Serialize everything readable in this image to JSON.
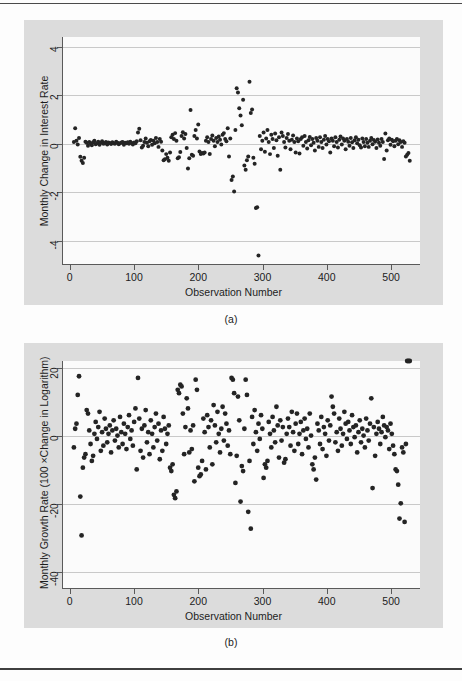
{
  "figure": {
    "panels": [
      {
        "caption": "(a)",
        "xlabel": "Observation Number",
        "ylabel": "Monthly Change in Interest Rate",
        "xticks": [
          "0",
          "100",
          "200",
          "300",
          "400",
          "500"
        ],
        "yticks": [
          "4",
          "2",
          "0",
          "-2",
          "-4"
        ]
      },
      {
        "caption": "(b)",
        "xlabel": "Observation Number",
        "ylabel": "Monthly Growth Rate (100 ×Change in Logarithm)",
        "xticks": [
          "0",
          "100",
          "200",
          "300",
          "400",
          "500"
        ],
        "yticks": [
          "20",
          "0",
          "-20",
          "-40"
        ]
      }
    ]
  },
  "colors": {
    "marker": "#242424",
    "graph_region": "#dcdcdc",
    "plot_region": "#fbfbfb",
    "gridline": "#c9c9c9",
    "axis": "#5a5a5a",
    "rule": "#4a4a4a"
  },
  "chart_data": [
    {
      "type": "scatter",
      "title": "",
      "panel": "(a)",
      "xlabel": "Observation Number",
      "ylabel": "Monthly Change in Interest Rate",
      "xlim": [
        -12,
        545
      ],
      "ylim": [
        -5.0,
        4.4
      ],
      "xticks": [
        0,
        100,
        200,
        300,
        400,
        500
      ],
      "yticks": [
        4,
        2,
        0,
        -2,
        -4
      ],
      "grid": true,
      "gridlines_y": [
        4,
        2,
        0,
        -2,
        -4
      ],
      "legend": null,
      "x": [
        5,
        7,
        9,
        11,
        13,
        15,
        17,
        19,
        21,
        23,
        25,
        27,
        29,
        31,
        33,
        35,
        37,
        39,
        41,
        43,
        45,
        47,
        49,
        51,
        53,
        55,
        57,
        59,
        61,
        63,
        65,
        67,
        69,
        71,
        73,
        75,
        77,
        79,
        81,
        83,
        85,
        87,
        89,
        91,
        93,
        95,
        97,
        99,
        101,
        103,
        105,
        107,
        109,
        111,
        113,
        115,
        117,
        119,
        121,
        123,
        125,
        127,
        129,
        131,
        133,
        135,
        137,
        139,
        141,
        143,
        145,
        147,
        149,
        151,
        153,
        155,
        157,
        159,
        161,
        163,
        165,
        167,
        169,
        171,
        173,
        175,
        177,
        179,
        181,
        183,
        185,
        187,
        189,
        191,
        193,
        195,
        197,
        199,
        201,
        203,
        205,
        207,
        209,
        211,
        213,
        215,
        217,
        219,
        221,
        223,
        225,
        227,
        229,
        231,
        233,
        235,
        237,
        239,
        241,
        243,
        245,
        247,
        249,
        251,
        253,
        255,
        257,
        259,
        261,
        263,
        265,
        267,
        269,
        271,
        273,
        275,
        277,
        279,
        281,
        283,
        285,
        287,
        289,
        291,
        293,
        295,
        297,
        299,
        301,
        303,
        305,
        307,
        309,
        311,
        313,
        315,
        317,
        319,
        321,
        323,
        325,
        327,
        329,
        331,
        333,
        335,
        337,
        339,
        341,
        343,
        345,
        347,
        349,
        351,
        353,
        355,
        357,
        359,
        361,
        363,
        365,
        367,
        369,
        371,
        373,
        375,
        377,
        379,
        381,
        383,
        385,
        387,
        389,
        391,
        393,
        395,
        397,
        399,
        401,
        403,
        405,
        407,
        409,
        411,
        413,
        415,
        417,
        419,
        421,
        423,
        425,
        427,
        429,
        431,
        433,
        435,
        437,
        439,
        441,
        443,
        445,
        447,
        449,
        451,
        453,
        455,
        457,
        459,
        461,
        463,
        465,
        467,
        469,
        471,
        473,
        475,
        477,
        479,
        481,
        483,
        485,
        487,
        489,
        491,
        493,
        495,
        497,
        499,
        501,
        503,
        505,
        507,
        509,
        511,
        513,
        515,
        517,
        519,
        521,
        523,
        525,
        527,
        529
      ],
      "y": [
        0.05,
        0.62,
        0.1,
        -0.05,
        0.22,
        -0.56,
        -0.72,
        -0.82,
        -0.6,
        0.06,
        0.02,
        -0.1,
        0.05,
        0.0,
        -0.08,
        0.04,
        0.1,
        -0.04,
        0.0,
        0.06,
        -0.06,
        0.02,
        0.08,
        -0.02,
        0.0,
        0.05,
        -0.05,
        0.03,
        0.01,
        -0.03,
        0.04,
        0.0,
        -0.02,
        0.06,
        0.02,
        -0.04,
        0.0,
        0.03,
        0.05,
        -0.06,
        0.02,
        0.0,
        0.04,
        -0.02,
        0.06,
        0.01,
        -0.05,
        0.03,
        0.0,
        0.08,
        0.45,
        0.6,
        0.12,
        -0.18,
        -0.1,
        0.05,
        0.2,
        0.02,
        -0.12,
        0.08,
        0.14,
        -0.06,
        0.1,
        0.0,
        0.22,
        0.05,
        -0.15,
        0.18,
        0.06,
        -0.3,
        -0.7,
        -0.66,
        -0.45,
        -0.6,
        -0.72,
        -0.38,
        0.25,
        0.35,
        0.18,
        0.42,
        0.1,
        -0.62,
        -0.58,
        -0.36,
        0.3,
        0.46,
        0.2,
        0.38,
        -0.2,
        -1.05,
        -0.62,
        1.38,
        -0.48,
        -0.52,
        0.3,
        0.55,
        0.2,
        0.78,
        -0.34,
        -0.45,
        -0.4,
        -0.42,
        -0.38,
        0.1,
        0.25,
        0.05,
        -0.44,
        0.18,
        0.32,
        0.1,
        -0.12,
        0.22,
        0.05,
        0.28,
        0.15,
        -0.05,
        0.35,
        0.42,
        0.18,
        0.08,
        0.62,
        -0.55,
        0.2,
        -1.52,
        -1.38,
        -2.0,
        0.55,
        2.28,
        2.1,
        1.45,
        1.15,
        0.75,
        1.8,
        -0.92,
        -1.1,
        -0.7,
        -0.55,
        2.55,
        1.25,
        1.4,
        -0.6,
        -0.85,
        -2.68,
        -2.65,
        -4.65,
        0.3,
        -0.25,
        0.1,
        0.45,
        -0.35,
        0.2,
        0.55,
        0.05,
        -0.45,
        0.35,
        0.18,
        -0.2,
        0.4,
        0.12,
        -0.52,
        0.25,
        -1.1,
        0.45,
        0.3,
        0.05,
        -0.18,
        0.22,
        0.38,
        0.1,
        -0.25,
        0.15,
        0.32,
        0.05,
        -0.38,
        0.2,
        0.08,
        -0.42,
        0.18,
        0.25,
        -0.1,
        0.3,
        0.05,
        -0.22,
        0.12,
        0.26,
        -0.08,
        0.18,
        0.02,
        -0.3,
        0.22,
        0.1,
        -0.15,
        0.25,
        0.05,
        -0.2,
        0.15,
        0.3,
        -0.05,
        0.18,
        0.08,
        -0.38,
        0.2,
        0.1,
        -0.12,
        0.25,
        0.05,
        -0.18,
        0.15,
        0.28,
        -0.05,
        0.2,
        0.1,
        -0.25,
        0.18,
        0.06,
        -0.1,
        0.22,
        0.04,
        -0.2,
        0.12,
        0.25,
        0.0,
        0.15,
        -0.08,
        -0.18,
        0.2,
        0.05,
        -0.12,
        0.18,
        0.02,
        -0.15,
        0.1,
        0.22,
        -0.04,
        0.14,
        0.06,
        -0.2,
        0.16,
        0.02,
        -0.1,
        0.18,
        0.05,
        -0.65,
        0.4,
        -0.3,
        0.12,
        0.2,
        -0.06,
        0.15,
        0.08,
        -0.12,
        0.1,
        0.18,
        -0.04,
        0.12,
        0.05,
        -0.15,
        0.08,
        0.02,
        -0.55,
        -0.48,
        -0.4,
        -0.72,
        -0.25,
        -0.58,
        -0.35,
        -0.2,
        -0.1,
        -0.3
      ]
    },
    {
      "type": "scatter",
      "title": "",
      "panel": "(b)",
      "xlabel": "Observation Number",
      "ylabel": "Monthly Growth Rate (100 ×Change in Logarithm)",
      "xlim": [
        -12,
        545
      ],
      "ylim": [
        -45,
        22
      ],
      "xticks": [
        0,
        100,
        200,
        300,
        400,
        500
      ],
      "yticks": [
        20,
        0,
        -20,
        -40
      ],
      "grid": true,
      "gridlines_y": [
        20,
        0,
        -20,
        -40
      ],
      "legend": null,
      "x": [
        5,
        7,
        9,
        11,
        13,
        15,
        17,
        19,
        21,
        23,
        25,
        27,
        29,
        31,
        33,
        35,
        37,
        39,
        41,
        43,
        45,
        47,
        49,
        51,
        53,
        55,
        57,
        59,
        61,
        63,
        65,
        67,
        69,
        71,
        73,
        75,
        77,
        79,
        81,
        83,
        85,
        87,
        89,
        91,
        93,
        95,
        97,
        99,
        101,
        103,
        105,
        107,
        109,
        111,
        113,
        115,
        117,
        119,
        121,
        123,
        125,
        127,
        129,
        131,
        133,
        135,
        137,
        139,
        141,
        143,
        145,
        147,
        149,
        151,
        153,
        155,
        157,
        159,
        161,
        163,
        165,
        167,
        169,
        171,
        173,
        175,
        177,
        179,
        181,
        183,
        185,
        187,
        189,
        191,
        193,
        195,
        197,
        199,
        201,
        203,
        205,
        207,
        209,
        211,
        213,
        215,
        217,
        219,
        221,
        223,
        225,
        227,
        229,
        231,
        233,
        235,
        237,
        239,
        241,
        243,
        245,
        247,
        249,
        251,
        253,
        255,
        257,
        259,
        261,
        263,
        265,
        267,
        269,
        271,
        273,
        275,
        277,
        279,
        281,
        283,
        285,
        287,
        289,
        291,
        293,
        295,
        297,
        299,
        301,
        303,
        305,
        307,
        309,
        311,
        313,
        315,
        317,
        319,
        321,
        323,
        325,
        327,
        329,
        331,
        333,
        335,
        337,
        339,
        341,
        343,
        345,
        347,
        349,
        351,
        353,
        355,
        357,
        359,
        361,
        363,
        365,
        367,
        369,
        371,
        373,
        375,
        377,
        379,
        381,
        383,
        385,
        387,
        389,
        391,
        393,
        395,
        397,
        399,
        401,
        403,
        405,
        407,
        409,
        411,
        413,
        415,
        417,
        419,
        421,
        423,
        425,
        427,
        429,
        431,
        433,
        435,
        437,
        439,
        441,
        443,
        445,
        447,
        449,
        451,
        453,
        455,
        457,
        459,
        461,
        463,
        465,
        467,
        469,
        471,
        473,
        475,
        477,
        479,
        481,
        483,
        485,
        487,
        489,
        491,
        493,
        495,
        497,
        499,
        501,
        503,
        505,
        507,
        509,
        511,
        513,
        515,
        517,
        519,
        521,
        523,
        525,
        527,
        529
      ],
      "y": [
        -3.5,
        2.0,
        3.5,
        12.0,
        17.5,
        -18.0,
        -29.5,
        -9.5,
        -6.5,
        -5.5,
        7.5,
        6.5,
        1.5,
        -2.5,
        -7.5,
        -6.0,
        0.5,
        4.0,
        -1.0,
        2.5,
        7.0,
        -4.5,
        1.0,
        -3.0,
        5.0,
        2.0,
        -2.0,
        0.5,
        3.0,
        -5.0,
        1.5,
        4.5,
        -1.5,
        2.0,
        0.0,
        -3.5,
        5.5,
        1.0,
        -2.5,
        3.5,
        0.5,
        -4.0,
        2.5,
        6.0,
        -1.0,
        1.5,
        -3.0,
        4.0,
        8.0,
        -10.0,
        17.0,
        5.0,
        -4.5,
        2.0,
        -6.5,
        3.0,
        7.5,
        -2.0,
        1.0,
        -5.5,
        4.5,
        0.5,
        -3.5,
        2.5,
        6.5,
        -1.5,
        3.5,
        -7.0,
        1.5,
        -4.5,
        5.5,
        2.0,
        -2.5,
        0.5,
        3.0,
        -9.5,
        -10.5,
        -8.5,
        -17.5,
        -18.5,
        -16.5,
        13.5,
        12.5,
        15.0,
        14.5,
        6.5,
        -5.5,
        2.5,
        11.0,
        8.0,
        -5.0,
        1.5,
        -4.0,
        3.0,
        -13.5,
        16.5,
        13.5,
        -9.5,
        -12.0,
        -11.5,
        -7.5,
        5.0,
        1.0,
        -10.0,
        6.0,
        2.5,
        -3.5,
        4.5,
        -8.5,
        9.0,
        3.0,
        -2.0,
        7.0,
        0.5,
        -5.0,
        2.0,
        8.5,
        -1.5,
        6.5,
        3.5,
        -3.0,
        1.5,
        -5.5,
        17.0,
        16.5,
        12.5,
        -14.0,
        -6.0,
        11.5,
        4.5,
        -19.5,
        -9.0,
        -10.5,
        2.0,
        16.5,
        12.0,
        -22.5,
        -7.5,
        -27.5,
        5.5,
        -2.5,
        7.5,
        1.0,
        -4.5,
        3.5,
        -1.0,
        6.0,
        2.0,
        -12.5,
        -8.5,
        -9.5,
        -7.5,
        4.0,
        0.5,
        -3.5,
        5.5,
        1.5,
        -2.0,
        8.5,
        3.0,
        -6.5,
        4.5,
        -1.5,
        2.5,
        -8.0,
        -7.0,
        0.5,
        5.0,
        2.5,
        -3.0,
        7.0,
        1.0,
        -4.5,
        3.5,
        6.5,
        -2.5,
        0.5,
        4.0,
        -5.5,
        1.5,
        5.0,
        -1.0,
        2.0,
        -3.5,
        6.5,
        0.0,
        -8.5,
        -10.0,
        -6.5,
        -13.0,
        3.5,
        1.5,
        -2.5,
        5.5,
        -4.0,
        2.5,
        0.5,
        -6.0,
        4.5,
        -1.5,
        3.0,
        11.5,
        8.5,
        6.5,
        -2.0,
        1.0,
        -4.5,
        5.0,
        2.0,
        -3.0,
        0.5,
        7.0,
        3.5,
        -1.0,
        4.0,
        1.5,
        -2.5,
        6.0,
        2.5,
        -0.5,
        3.0,
        -5.0,
        1.0,
        4.5,
        -2.0,
        2.0,
        0.0,
        -3.5,
        5.0,
        1.5,
        -1.5,
        3.5,
        11.0,
        -15.5,
        2.5,
        -6.0,
        0.5,
        4.0,
        2.0,
        -2.5,
        1.0,
        5.5,
        3.0,
        -0.5,
        2.5,
        1.5,
        -4.0,
        3.5,
        0.5,
        -3.0,
        -5.5,
        -10.0,
        -10.5,
        -14.5,
        -24.5,
        -20.0,
        -3.5,
        -5.0,
        -25.5,
        -2.5
      ]
    }
  ]
}
